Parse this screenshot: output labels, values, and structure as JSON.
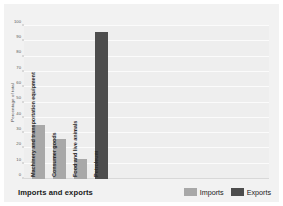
{
  "chart_data": {
    "type": "bar",
    "title": "Imports and exports",
    "xlabel": "",
    "ylabel": "Percentage of total",
    "ylim": [
      0,
      100
    ],
    "yticks": [
      0,
      10,
      20,
      30,
      40,
      50,
      60,
      70,
      80,
      90,
      100
    ],
    "grid": true,
    "legend_position": "bottom-right",
    "categories": [
      "Machinery and transportation equipment",
      "Consumer goods",
      "Food and live animals",
      "Petroleum"
    ],
    "values": [
      35,
      26,
      13,
      96
    ],
    "series": [
      {
        "name": "Imports",
        "color": "#a8a8a8",
        "points": [
          {
            "category": "Machinery and transportation equipment",
            "value": 35
          },
          {
            "category": "Consumer goods",
            "value": 26
          },
          {
            "category": "Food and live animals",
            "value": 13
          }
        ]
      },
      {
        "name": "Exports",
        "color": "#4d4d4d",
        "points": [
          {
            "category": "Petroleum",
            "value": 96
          }
        ]
      }
    ],
    "bars": [
      {
        "label": "Machinery and transportation equipment",
        "value": 35,
        "series": "Imports",
        "color": "#a8a8a8"
      },
      {
        "label": "Consumer goods",
        "value": 26,
        "series": "Imports",
        "color": "#a8a8a8"
      },
      {
        "label": "Food and live animals",
        "value": 13,
        "series": "Imports",
        "color": "#a8a8a8"
      },
      {
        "label": "Petroleum",
        "value": 96,
        "series": "Exports",
        "color": "#4d4d4d"
      }
    ]
  },
  "legend": {
    "items": [
      {
        "label": "Imports",
        "color": "#a8a8a8"
      },
      {
        "label": "Exports",
        "color": "#4d4d4d"
      }
    ]
  },
  "colors": {
    "figure_background": "#f2f2f2",
    "plot_background": "#eeeeee",
    "gridline": "#fbfbfb",
    "imports": "#a8a8a8",
    "exports": "#4d4d4d",
    "text": "#1a1a1a"
  }
}
